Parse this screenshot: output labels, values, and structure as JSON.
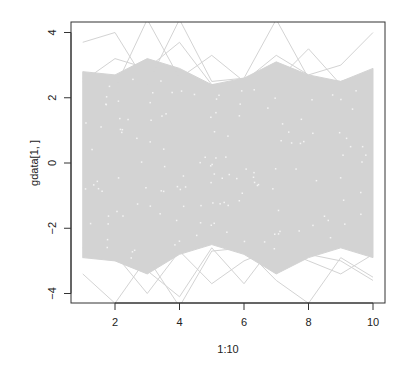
{
  "chart_data": {
    "type": "line",
    "title": "",
    "xlabel": "1:10",
    "ylabel": "gdata[1, ]",
    "x": [
      1,
      2,
      3,
      4,
      5,
      6,
      7,
      8,
      9,
      10
    ],
    "xlim": [
      0.7,
      10.3
    ],
    "ylim": [
      -4.3,
      4.3
    ],
    "xticks": [
      2,
      4,
      6,
      8,
      10
    ],
    "yticks": [
      -4,
      -2,
      0,
      2,
      4
    ],
    "grid": false,
    "legend": null,
    "line_color": "#d3d3d3",
    "envelope": {
      "upper": [
        2.8,
        2.7,
        3.2,
        2.9,
        2.4,
        2.6,
        3.1,
        2.7,
        2.5,
        2.9
      ],
      "lower": [
        -2.9,
        -3.0,
        -3.4,
        -2.8,
        -2.5,
        -2.8,
        -3.4,
        -2.9,
        -2.6,
        -2.9
      ]
    },
    "series": [
      {
        "name": "outlier-1",
        "values": [
          3.7,
          4.0,
          2.4,
          4.4,
          2.5,
          2.6,
          4.4,
          2.6,
          2.5,
          2.8
        ]
      },
      {
        "name": "outlier-2",
        "values": [
          2.6,
          2.3,
          4.4,
          2.6,
          3.3,
          2.5,
          3.3,
          2.7,
          3.0,
          4.0
        ]
      },
      {
        "name": "outlier-3",
        "values": [
          2.5,
          3.2,
          2.9,
          3.7,
          2.4,
          2.4,
          2.5,
          3.5,
          2.4,
          2.6
        ]
      },
      {
        "name": "outlier-4",
        "values": [
          -3.4,
          -4.3,
          -2.9,
          -4.4,
          -2.7,
          -2.6,
          -3.6,
          -4.3,
          -2.9,
          -3.5
        ]
      },
      {
        "name": "outlier-5",
        "values": [
          -2.6,
          -2.8,
          -4.0,
          -2.7,
          -3.7,
          -3.0,
          -2.6,
          -3.0,
          -3.4,
          -2.8
        ]
      },
      {
        "name": "outlier-6",
        "values": [
          -2.9,
          -2.5,
          -3.3,
          -4.1,
          -2.6,
          -3.7,
          -2.4,
          -2.8,
          -3.0,
          -3.6
        ]
      }
    ]
  }
}
